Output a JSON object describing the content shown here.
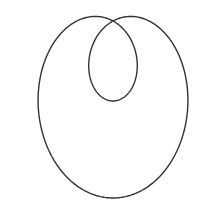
{
  "figure": {
    "type": "limacon-with-inner-loop",
    "equation": "r = b + a·sin(θ)",
    "a": 128.5,
    "b": 48.5,
    "pole": [
      113,
      21
    ],
    "stroke_color": "#333333",
    "background": "#ffffff",
    "stroke_width": 1.4
  }
}
